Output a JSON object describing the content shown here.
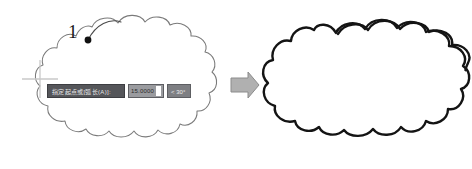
{
  "figure": {
    "type": "cad-revision-cloud-illustration",
    "background_color": "#ffffff",
    "width": 472,
    "height": 169
  },
  "callout": {
    "number": "1",
    "marker": "filled-dot",
    "marker_color": "#111111",
    "leader": "curved-line-to-cloud"
  },
  "left_panel": {
    "shape_name": "revision-cloud-preview",
    "stroke_color": "#7a7a7a",
    "stroke_width": 1,
    "fill": "none",
    "crosshair": {
      "name": "crosshair-cursor",
      "color": "#c9c9c9"
    }
  },
  "dynamic_input": {
    "prompt_label": "指定起点或[弧长(A)]:",
    "value": "15.0000",
    "angle": "< 30°",
    "caret_visible": true,
    "prompt_bg": "#55565a",
    "value_bg": "#9a9b9f",
    "angle_bg": "#7e7f83"
  },
  "arrow": {
    "name": "transform-arrow",
    "direction": "right",
    "fill_color": "#b0b0b0",
    "stroke_color": "#8c8c8c"
  },
  "right_panel": {
    "shape_name": "revision-cloud-result",
    "stroke_color": "#141414",
    "stroke_width": 2.4,
    "fill": "none"
  }
}
